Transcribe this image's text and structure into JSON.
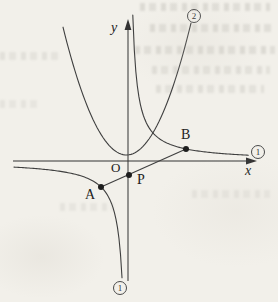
{
  "figure": {
    "canvas": {
      "width": 278,
      "height": 302,
      "background": "#f2f0ea",
      "stroke_color": "#3f3f3f",
      "axis_color": "#333333",
      "point_color": "#1e1e1e"
    },
    "axes": {
      "x_label": "x",
      "y_label": "y",
      "origin_label": "O",
      "origin": [
        128,
        161
      ],
      "x_start": 13,
      "x_tip": 257,
      "y_start": 281,
      "y_tip": 19
    },
    "curves": {
      "hyperbola": {
        "name": "curve-1-hyperbola",
        "k": 700,
        "branch_q1_x": [
          132.8,
          249
        ],
        "branch_q3_x": [
          14,
          122
        ]
      },
      "parabola": {
        "name": "curve-2-parabola",
        "vertex": [
          126.5,
          155
        ],
        "a": 0.0317,
        "x_range": [
          63,
          192
        ]
      }
    },
    "segment": {
      "from": "A",
      "to": "B"
    },
    "points": {
      "A": {
        "label": "A",
        "x": 101,
        "y": 187
      },
      "B": {
        "label": "B",
        "x": 186,
        "y": 149
      },
      "P": {
        "label": "P",
        "x": 129,
        "y": 175
      }
    },
    "curve_labels": {
      "parabola_top": "2",
      "hyperbola_right": "1",
      "hyperbola_bottom": "1"
    }
  }
}
